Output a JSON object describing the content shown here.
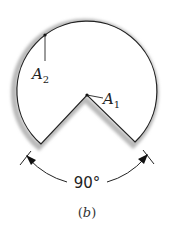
{
  "figure": {
    "caption": "(b)",
    "caption_letter": "b",
    "labels": {
      "a2": {
        "main": "A",
        "sub": "2"
      },
      "a1": {
        "main": "A",
        "sub": "1"
      }
    },
    "angle_label": "90°",
    "colors": {
      "outline": "#222222",
      "shadow": "#b5b5b5"
    }
  }
}
